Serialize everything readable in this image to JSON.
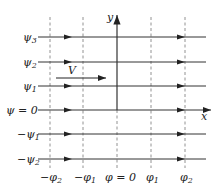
{
  "diagram": {
    "axes": {
      "x_label": "x",
      "y_label": "y"
    },
    "velocity_label": "V",
    "streamlines": [
      {
        "label": "ψ3",
        "base": "ψ",
        "sub": "3",
        "sign": "",
        "y": 37
      },
      {
        "label": "ψ2",
        "base": "ψ",
        "sub": "2",
        "sign": "",
        "y": 62
      },
      {
        "label": "ψ1",
        "base": "ψ",
        "sub": "1",
        "sign": "",
        "y": 86
      },
      {
        "label": "ψ = 0",
        "base": "ψ = 0",
        "sub": "",
        "sign": "",
        "y": 110
      },
      {
        "label": "−ψ1",
        "base": "ψ",
        "sub": "1",
        "sign": "−",
        "y": 134
      },
      {
        "label": "−ψ2",
        "base": "ψ",
        "sub": "2",
        "sign": "−",
        "y": 159
      }
    ],
    "equipotentials": [
      {
        "label": "−φ2",
        "base": "φ",
        "sub": "2",
        "sign": "−",
        "x": 50
      },
      {
        "label": "−φ1",
        "base": "φ",
        "sub": "1",
        "sign": "−",
        "x": 83
      },
      {
        "label": "φ = 0",
        "base": "φ = 0",
        "sub": "",
        "sign": "",
        "x": 117
      },
      {
        "label": "φ1",
        "base": "φ",
        "sub": "1",
        "sign": "",
        "x": 151
      },
      {
        "label": "φ2",
        "base": "φ",
        "sub": "2",
        "sign": "",
        "x": 185
      }
    ],
    "colors": {
      "line": "#333333",
      "dashed": "#777777",
      "text": "#222222"
    }
  }
}
